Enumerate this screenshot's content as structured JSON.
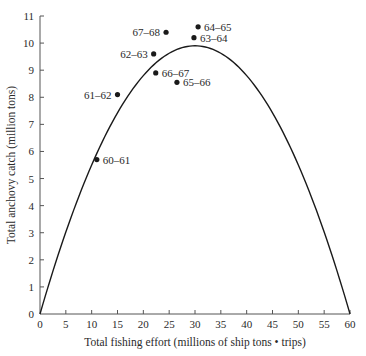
{
  "chart_data": {
    "type": "scatter",
    "title": "",
    "xlabel": "Total fishing effort (millions of ship tons • trips)",
    "ylabel": "Total anchovy catch (million tons)",
    "xlim": [
      0,
      60
    ],
    "ylim": [
      0,
      11
    ],
    "xticks": [
      0,
      5,
      10,
      15,
      20,
      25,
      30,
      35,
      40,
      45,
      50,
      55,
      60
    ],
    "yticks": [
      0,
      1,
      2,
      3,
      4,
      5,
      6,
      7,
      8,
      9,
      10,
      11
    ],
    "grid": false,
    "legend": null,
    "series": [
      {
        "name": "Observed catch by season",
        "type": "scatter",
        "points": [
          {
            "label": "60–61",
            "x": 11.0,
            "y": 5.7
          },
          {
            "label": "61–62",
            "x": 15.0,
            "y": 8.1
          },
          {
            "label": "62–63",
            "x": 22.0,
            "y": 9.6
          },
          {
            "label": "63–64",
            "x": 29.8,
            "y": 10.2
          },
          {
            "label": "64–65",
            "x": 30.6,
            "y": 10.6
          },
          {
            "label": "65–66",
            "x": 26.5,
            "y": 8.55
          },
          {
            "label": "66–67",
            "x": 22.4,
            "y": 8.9
          },
          {
            "label": "67–68",
            "x": 24.4,
            "y": 10.4
          }
        ]
      },
      {
        "name": "Fitted yield curve",
        "type": "line",
        "model": "parabola",
        "vertex": {
          "x": 30,
          "y": 9.9
        },
        "roots": [
          0,
          60
        ]
      }
    ]
  },
  "colors": {
    "ink": "#1a1a1a",
    "text": "#2a2a2a",
    "axis": "#555555",
    "background": "#ffffff"
  }
}
